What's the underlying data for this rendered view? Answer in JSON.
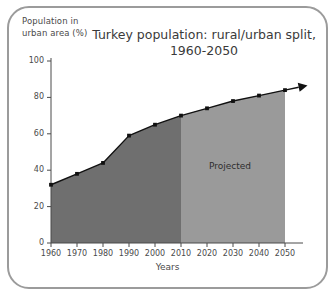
{
  "chart_data": {
    "type": "area",
    "title": "Turkey population: rural/urban split, 1960-2050",
    "title_lines": [
      "Turkey population: rural/urban split,",
      "1960-2050"
    ],
    "xlabel": "Years",
    "ylabel": "Population in urban area (%)",
    "ylabel_lines": [
      "Population in",
      "urban area (%)"
    ],
    "x": [
      1960,
      1970,
      1980,
      1990,
      2000,
      2010,
      2020,
      2030,
      2040,
      2050
    ],
    "values": [
      32,
      38,
      44,
      59,
      65,
      70,
      74,
      78,
      81,
      84
    ],
    "series": [
      {
        "name": "Population in urban area (%)",
        "values": [
          32,
          38,
          44,
          59,
          65,
          70,
          74,
          78,
          81,
          84
        ]
      }
    ],
    "xlim": [
      1960,
      2050
    ],
    "ylim": [
      0,
      100
    ],
    "xticks": [
      1960,
      1970,
      1980,
      1990,
      2000,
      2010,
      2020,
      2030,
      2040,
      2050
    ],
    "xtick_labels": [
      "1960",
      "1970",
      "1980",
      "1990",
      "2000",
      "2010",
      "2020",
      "2030",
      "2040",
      "2050"
    ],
    "yticks": [
      0,
      20,
      40,
      60,
      80,
      100
    ],
    "ytick_labels": [
      "0",
      "20",
      "40",
      "60",
      "80",
      "100"
    ],
    "grid": false,
    "legend": null,
    "annotations": [
      {
        "text": "Projected",
        "x": 2030,
        "y": 42,
        "region_start": 2010,
        "region_end": 2050
      }
    ],
    "regions": [
      {
        "name": "historical",
        "x_start": 1960,
        "x_end": 2010,
        "fill": "#6f6f6f"
      },
      {
        "name": "projected",
        "x_start": 2010,
        "x_end": 2050,
        "fill": "#9a9a9a"
      }
    ],
    "line_color": "#111111",
    "marker": "square",
    "marker_color": "#111111",
    "arrow_end": true,
    "axis_color": "#4a4a4a",
    "frame_color": "#9b9b9b",
    "background": "#ffffff"
  }
}
